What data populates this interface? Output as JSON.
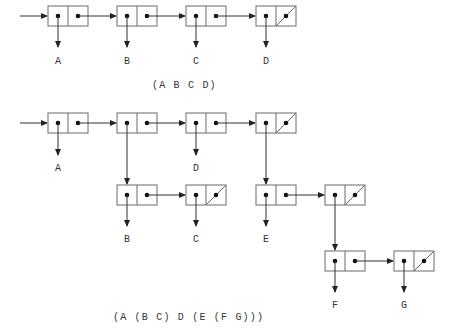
{
  "diagram1": {
    "caption": "(A B C D)",
    "labels": {
      "a": "A",
      "b": "B",
      "c": "C",
      "d": "D"
    }
  },
  "diagram2": {
    "caption": "(A (B C) D (E (F G)))",
    "labels": {
      "a": "A",
      "d": "D",
      "b": "B",
      "c": "C",
      "e": "E",
      "f": "F",
      "g": "G"
    }
  },
  "colors": {
    "line": "#333333",
    "box_stroke": "#6a6a6a",
    "dot": "#111111",
    "background": "#ffffff"
  }
}
